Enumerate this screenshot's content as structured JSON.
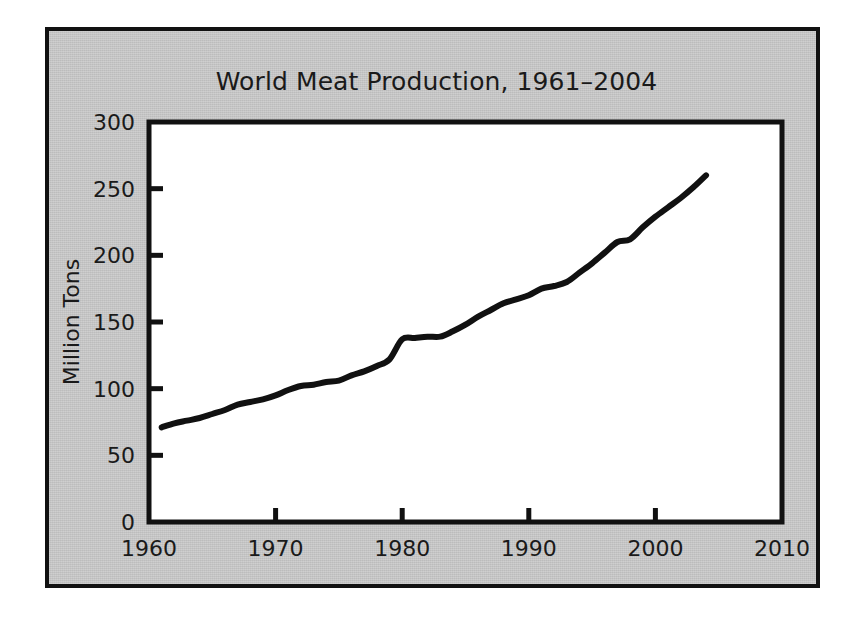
{
  "figure": {
    "background_color": "#ffffff",
    "panel_color": "#c6c6c6",
    "frame_color": "#111111",
    "plot_background": "#ffffff",
    "line_color": "#111111",
    "text_color": "#1a1a1a"
  },
  "chart_data": {
    "type": "line",
    "title": "World Meat Production, 1961–2004",
    "xlabel": "",
    "ylabel": "Million Tons",
    "xlim": [
      1960,
      2010
    ],
    "ylim": [
      0,
      300
    ],
    "xticks": [
      1960,
      1970,
      1980,
      1990,
      2000,
      2010
    ],
    "xtick_labels": [
      "1960",
      "1970",
      "1980",
      "1990",
      "2000",
      "2010"
    ],
    "yticks": [
      0,
      50,
      100,
      150,
      200,
      250,
      300
    ],
    "ytick_labels": [
      "0",
      "50",
      "100",
      "150",
      "200",
      "250",
      "300"
    ],
    "grid": false,
    "legend": null,
    "tick_direction": "in",
    "series": [
      {
        "name": "World Meat Production",
        "units": "million tons",
        "x": [
          1961,
          1962,
          1963,
          1964,
          1965,
          1966,
          1967,
          1968,
          1969,
          1970,
          1971,
          1972,
          1973,
          1974,
          1975,
          1976,
          1977,
          1978,
          1979,
          1980,
          1981,
          1982,
          1983,
          1984,
          1985,
          1986,
          1987,
          1988,
          1989,
          1990,
          1991,
          1992,
          1993,
          1994,
          1995,
          1996,
          1997,
          1998,
          1999,
          2000,
          2001,
          2002,
          2003,
          2004
        ],
        "values": [
          71,
          74,
          76,
          78,
          81,
          84,
          88,
          90,
          92,
          95,
          99,
          102,
          103,
          105,
          106,
          110,
          113,
          117,
          122,
          137,
          138,
          139,
          139,
          143,
          148,
          154,
          159,
          164,
          167,
          170,
          175,
          177,
          180,
          187,
          194,
          202,
          210,
          212,
          221,
          229,
          236,
          243,
          251,
          260
        ]
      }
    ]
  },
  "axis": {
    "y_title": "Million Tons"
  }
}
